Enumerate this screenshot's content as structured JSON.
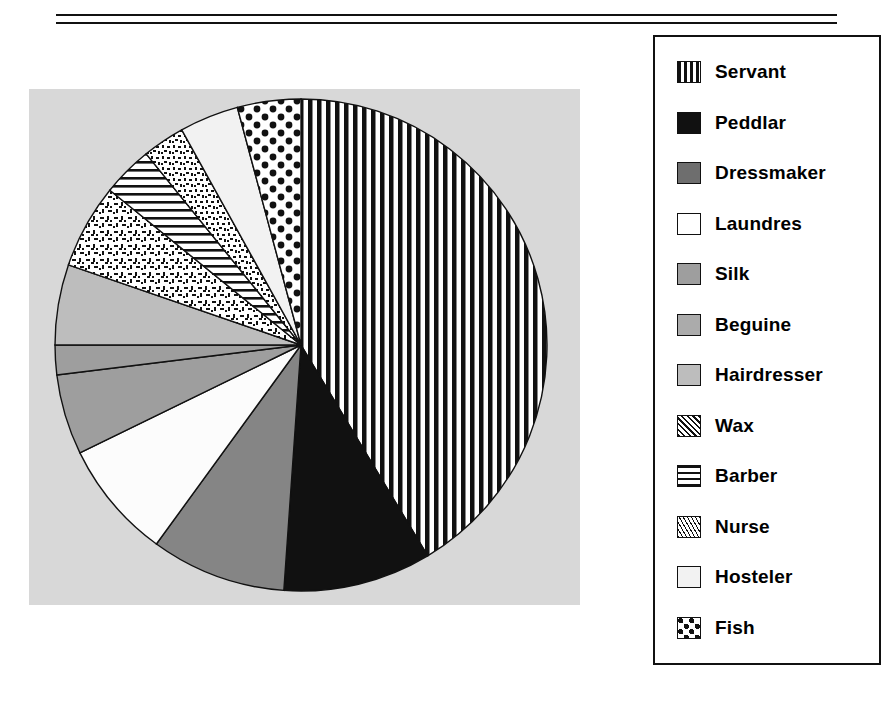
{
  "figure": {
    "background": "#ffffff",
    "plot_background": "#d8d8d8",
    "rule_color": "#111111"
  },
  "legend": {
    "border_color": "#111111",
    "items": [
      {
        "label": "Servant",
        "pattern": "vertical-stripes"
      },
      {
        "label": "Peddlar",
        "pattern": "solid-black"
      },
      {
        "label": "Dressmaker",
        "pattern": "dark-gray"
      },
      {
        "label": "Laundres",
        "pattern": "white"
      },
      {
        "label": "Silk",
        "pattern": "medium-gray"
      },
      {
        "label": "Beguine",
        "pattern": "gray"
      },
      {
        "label": "Hairdresser",
        "pattern": "light-gray"
      },
      {
        "label": "Wax",
        "pattern": "coarse-speckle"
      },
      {
        "label": "Barber",
        "pattern": "horizontal-lines"
      },
      {
        "label": "Nurse",
        "pattern": "fine-speckle"
      },
      {
        "label": "Hosteler",
        "pattern": "near-white"
      },
      {
        "label": "Fish",
        "pattern": "checkerboard-dots"
      }
    ]
  },
  "chart_data": {
    "type": "pie",
    "title": "",
    "xlabel": "",
    "ylabel": "",
    "legend_position": "right",
    "grid": false,
    "start_angle_deg": 0,
    "direction": "clockwise",
    "categories": [
      "Servant",
      "Peddlar",
      "Dressmaker",
      "Laundres",
      "Silk",
      "Beguine",
      "Hairdresser",
      "Wax",
      "Barber",
      "Nurse",
      "Hosteler",
      "Fish"
    ],
    "values": [
      41.4,
      9.7,
      8.9,
      7.8,
      5.3,
      1.9,
      5.3,
      5.6,
      3.3,
      2.8,
      3.9,
      4.1
    ],
    "units": "percent",
    "angles_deg": [
      149.0,
      35.0,
      32.0,
      28.0,
      19.0,
      7.0,
      19.0,
      20.0,
      12.0,
      10.0,
      14.0,
      15.0
    ],
    "slices": [
      {
        "name": "Servant",
        "percent": 41.4,
        "angle_deg": 149.0,
        "start_deg": 0.0,
        "end_deg": 149.0,
        "pattern": "vertical-stripes",
        "fill": "#ffffff"
      },
      {
        "name": "Peddlar",
        "percent": 9.7,
        "angle_deg": 35.0,
        "start_deg": 149.0,
        "end_deg": 184.0,
        "pattern": "solid-black",
        "fill": "#111111"
      },
      {
        "name": "Dressmaker",
        "percent": 8.9,
        "angle_deg": 32.0,
        "start_deg": 184.0,
        "end_deg": 216.0,
        "pattern": "dark-gray",
        "fill": "#858585"
      },
      {
        "name": "Laundres",
        "percent": 7.8,
        "angle_deg": 28.0,
        "start_deg": 216.0,
        "end_deg": 244.0,
        "pattern": "white",
        "fill": "#fcfcfc"
      },
      {
        "name": "Silk",
        "percent": 5.3,
        "angle_deg": 19.0,
        "start_deg": 244.0,
        "end_deg": 263.0,
        "pattern": "medium-gray",
        "fill": "#9e9e9e"
      },
      {
        "name": "Beguine",
        "percent": 1.9,
        "angle_deg": 7.0,
        "start_deg": 263.0,
        "end_deg": 270.0,
        "pattern": "gray",
        "fill": "#9e9e9e"
      },
      {
        "name": "Hairdresser",
        "percent": 5.3,
        "angle_deg": 19.0,
        "start_deg": 270.0,
        "end_deg": 289.0,
        "pattern": "light-gray",
        "fill": "#bdbdbd"
      },
      {
        "name": "Wax",
        "percent": 5.6,
        "angle_deg": 20.0,
        "start_deg": 289.0,
        "end_deg": 309.0,
        "pattern": "coarse-speckle",
        "fill": "#ffffff"
      },
      {
        "name": "Barber",
        "percent": 3.3,
        "angle_deg": 12.0,
        "start_deg": 309.0,
        "end_deg": 321.0,
        "pattern": "horizontal-lines",
        "fill": "#ffffff"
      },
      {
        "name": "Nurse",
        "percent": 2.8,
        "angle_deg": 10.0,
        "start_deg": 321.0,
        "end_deg": 331.0,
        "pattern": "fine-speckle",
        "fill": "#ffffff"
      },
      {
        "name": "Hosteler",
        "percent": 3.9,
        "angle_deg": 14.0,
        "start_deg": 331.0,
        "end_deg": 345.0,
        "pattern": "near-white",
        "fill": "#f2f2f2"
      },
      {
        "name": "Fish",
        "percent": 4.1,
        "angle_deg": 15.0,
        "start_deg": 345.0,
        "end_deg": 360.0,
        "pattern": "checkerboard-dots",
        "fill": "#ffffff"
      }
    ],
    "geometry": {
      "cx": 272,
      "cy": 256,
      "r": 246
    }
  }
}
